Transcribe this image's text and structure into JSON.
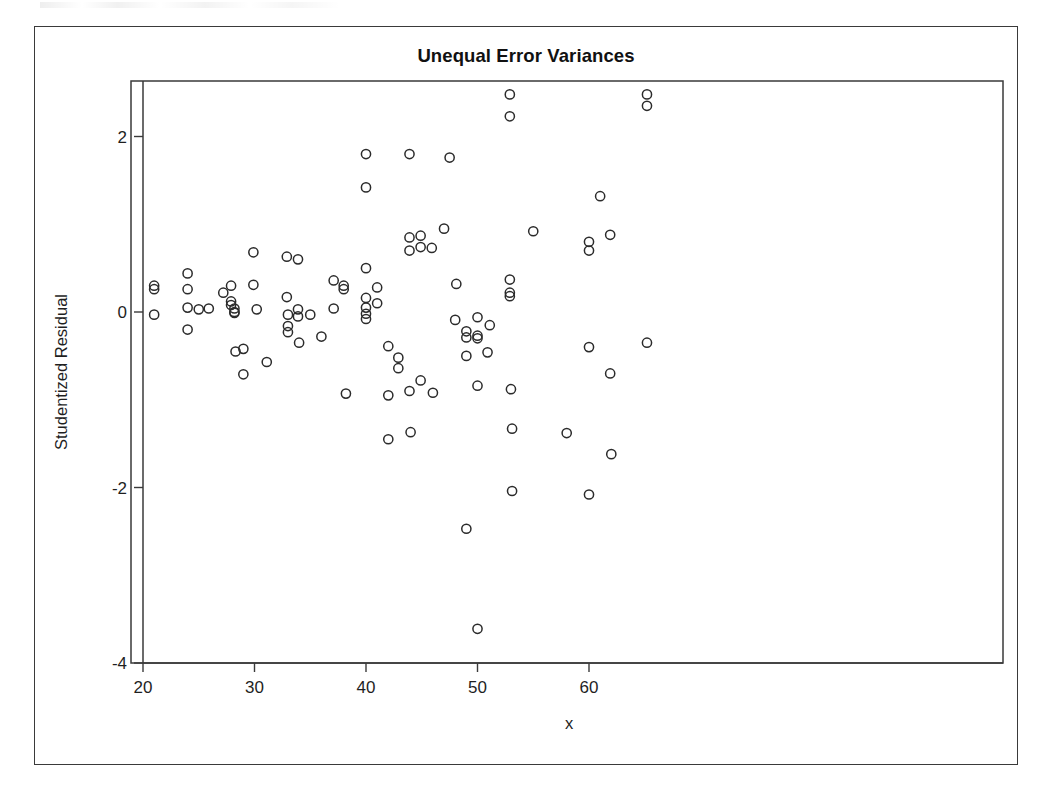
{
  "figure": {
    "title": "Unequal Error Variances",
    "frame_color": "#3a3a3a",
    "background": "#ffffff",
    "marker_color": "#2b2b2b"
  },
  "chart_data": {
    "type": "scatter",
    "title": "Unequal Error Variances",
    "xlabel": "x",
    "ylabel": "Studentized Residual",
    "xlim": [
      19.0,
      66.2
    ],
    "ylim": [
      -4.35,
      2.75
    ],
    "xticks": [
      20,
      30,
      40,
      50,
      60
    ],
    "xticklabels": [
      "20",
      "30",
      "40",
      "50",
      "60"
    ],
    "yticks": [
      2,
      0,
      -2,
      -4
    ],
    "yticklabels": [
      "2",
      "0",
      "-2",
      "-4"
    ],
    "grid": false,
    "legend": null,
    "marker": "open-circle",
    "n_points": 108,
    "points": [
      [
        21.0,
        0.3
      ],
      [
        21.0,
        0.26
      ],
      [
        21.0,
        -0.03
      ],
      [
        24.0,
        0.44
      ],
      [
        24.0,
        0.26
      ],
      [
        24.0,
        0.05
      ],
      [
        24.0,
        -0.2
      ],
      [
        25.0,
        0.03
      ],
      [
        25.9,
        0.04
      ],
      [
        27.2,
        0.22
      ],
      [
        27.9,
        0.3
      ],
      [
        27.9,
        0.12
      ],
      [
        27.9,
        0.08
      ],
      [
        28.2,
        0.04
      ],
      [
        28.2,
        0.0
      ],
      [
        28.2,
        -0.01
      ],
      [
        28.3,
        -0.45
      ],
      [
        29.0,
        -0.42
      ],
      [
        29.0,
        -0.71
      ],
      [
        29.9,
        0.68
      ],
      [
        29.9,
        0.31
      ],
      [
        30.2,
        0.03
      ],
      [
        31.1,
        -0.57
      ],
      [
        32.9,
        0.63
      ],
      [
        32.9,
        0.17
      ],
      [
        33.0,
        -0.03
      ],
      [
        33.0,
        -0.16
      ],
      [
        33.0,
        -0.23
      ],
      [
        33.9,
        0.6
      ],
      [
        33.9,
        0.03
      ],
      [
        33.9,
        -0.05
      ],
      [
        34.0,
        -0.35
      ],
      [
        35.0,
        -0.03
      ],
      [
        36.0,
        -0.28
      ],
      [
        37.1,
        0.36
      ],
      [
        37.1,
        0.04
      ],
      [
        38.0,
        0.3
      ],
      [
        38.0,
        0.26
      ],
      [
        38.2,
        -0.93
      ],
      [
        40.0,
        1.8
      ],
      [
        40.0,
        1.42
      ],
      [
        40.0,
        0.5
      ],
      [
        40.0,
        0.16
      ],
      [
        40.0,
        0.05
      ],
      [
        40.0,
        -0.02
      ],
      [
        40.0,
        -0.08
      ],
      [
        41.0,
        0.28
      ],
      [
        41.0,
        0.1
      ],
      [
        42.0,
        -0.39
      ],
      [
        42.0,
        -0.95
      ],
      [
        42.0,
        -1.45
      ],
      [
        42.9,
        -0.52
      ],
      [
        42.9,
        -0.64
      ],
      [
        43.9,
        1.8
      ],
      [
        43.9,
        0.85
      ],
      [
        43.9,
        0.7
      ],
      [
        43.9,
        -0.9
      ],
      [
        44.0,
        -1.37
      ],
      [
        44.9,
        0.87
      ],
      [
        44.9,
        0.74
      ],
      [
        44.9,
        -0.78
      ],
      [
        45.9,
        0.73
      ],
      [
        46.0,
        -0.92
      ],
      [
        47.0,
        0.95
      ],
      [
        47.5,
        1.76
      ],
      [
        48.0,
        -0.09
      ],
      [
        48.1,
        0.32
      ],
      [
        49.0,
        -0.22
      ],
      [
        49.0,
        -0.29
      ],
      [
        49.0,
        -0.5
      ],
      [
        49.0,
        -2.47
      ],
      [
        50.0,
        -0.06
      ],
      [
        50.0,
        -0.27
      ],
      [
        50.0,
        -0.3
      ],
      [
        50.0,
        -0.84
      ],
      [
        50.0,
        -3.61
      ],
      [
        50.9,
        -0.46
      ],
      [
        51.1,
        -0.15
      ],
      [
        52.9,
        2.48
      ],
      [
        52.9,
        2.23
      ],
      [
        52.9,
        0.37
      ],
      [
        52.9,
        0.22
      ],
      [
        52.9,
        0.18
      ],
      [
        53.0,
        -0.88
      ],
      [
        53.1,
        -1.33
      ],
      [
        53.1,
        -2.04
      ],
      [
        55.0,
        0.92
      ],
      [
        58.0,
        -1.38
      ],
      [
        60.0,
        0.8
      ],
      [
        60.0,
        0.7
      ],
      [
        60.0,
        -0.4
      ],
      [
        60.0,
        -2.08
      ],
      [
        61.0,
        1.32
      ],
      [
        61.9,
        0.88
      ],
      [
        61.9,
        -0.7
      ],
      [
        62.0,
        -1.62
      ],
      [
        65.2,
        2.48
      ],
      [
        65.2,
        2.35
      ],
      [
        65.2,
        -0.35
      ]
    ]
  }
}
